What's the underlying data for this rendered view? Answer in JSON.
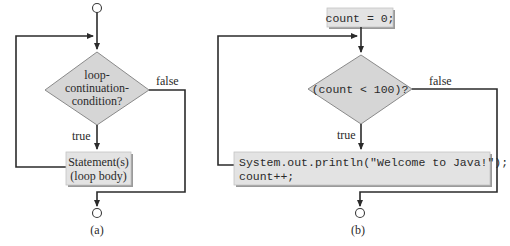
{
  "figure": {
    "panels": [
      {
        "id": "a",
        "caption": "(a)",
        "condition_lines": [
          "loop-",
          "continuation-",
          "condition?"
        ],
        "true_label": "true",
        "false_label": "false",
        "body_lines": [
          "Statement(s)",
          "(loop body)"
        ]
      },
      {
        "id": "b",
        "caption": "(b)",
        "init_statement": "count = 0;",
        "condition_lines": [
          "(count < 100)?"
        ],
        "true_label": "true",
        "false_label": "false",
        "body_lines": [
          "System.out.println(\"Welcome to Java!\");",
          "count++;"
        ]
      }
    ]
  },
  "colors": {
    "line": "#2b2b2b",
    "shape_fill": "#d6d6d6",
    "box_fill": "#e3e3e3",
    "text": "#2a2a2a"
  }
}
